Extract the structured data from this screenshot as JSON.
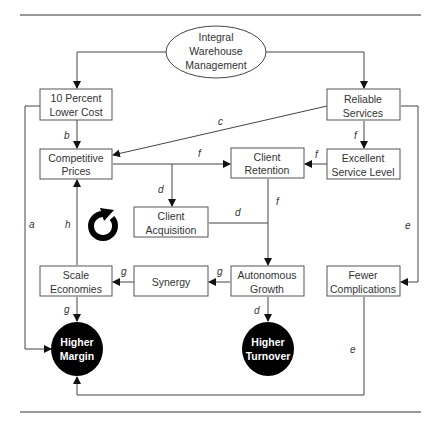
{
  "diagram": {
    "root": {
      "lines": [
        "Integral",
        "Warehouse",
        "Management"
      ]
    },
    "nodes": {
      "lower_cost": {
        "lines": [
          "10 Percent",
          "Lower Cost"
        ]
      },
      "reliable_services": {
        "lines": [
          "Reliable",
          "Services"
        ]
      },
      "competitive_prices": {
        "lines": [
          "Competitive",
          "Prices"
        ]
      },
      "client_retention": {
        "lines": [
          "Client",
          "Retention"
        ]
      },
      "excellent_service": {
        "lines": [
          "Excellent",
          "Service Level"
        ]
      },
      "client_acquisition": {
        "lines": [
          "Client",
          "Acquisition"
        ]
      },
      "scale_economies": {
        "lines": [
          "Scale",
          "Economies"
        ]
      },
      "synergy": {
        "lines": [
          "Synergy"
        ]
      },
      "autonomous_growth": {
        "lines": [
          "Autonomous",
          "Growth"
        ]
      },
      "fewer_complications": {
        "lines": [
          "Fewer",
          "Complications"
        ]
      }
    },
    "outcomes": {
      "higher_margin": {
        "lines": [
          "Higher",
          "Margin"
        ]
      },
      "higher_turnover": {
        "lines": [
          "Higher",
          "Turnover"
        ]
      }
    },
    "edge_labels": {
      "a": "a",
      "b": "b",
      "c": "c",
      "d1": "d",
      "d2": "d",
      "d3": "d",
      "e1": "e",
      "e2": "e",
      "f1": "f",
      "f2": "f",
      "f3": "f",
      "f4": "f",
      "g1": "g",
      "g2": "g",
      "g3": "g",
      "h": "h"
    },
    "icons": {
      "cycle": "circular-arrow-icon"
    },
    "colors": {
      "line": "#333333",
      "outcome_fill": "#000000",
      "outcome_text": "#ffffff",
      "box_border": "#555555"
    }
  }
}
